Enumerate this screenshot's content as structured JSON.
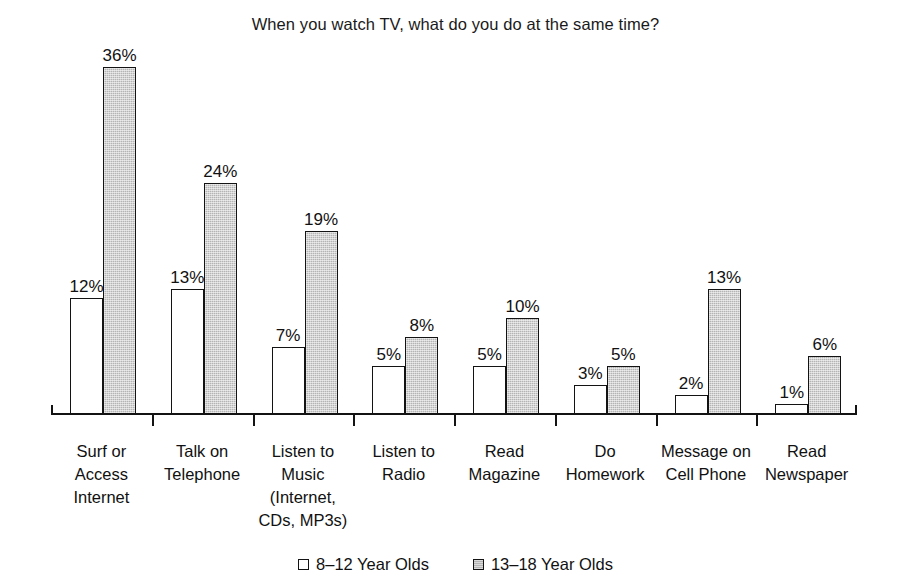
{
  "chart_data": {
    "type": "bar",
    "title": "When you watch TV, what do you do at the same time?",
    "xlabel": "",
    "ylabel": "",
    "ylim": [
      0,
      38
    ],
    "grid": false,
    "legend_position": "bottom",
    "value_suffix": "%",
    "categories": [
      "Surf or\nAccess\nInternet",
      "Talk on\nTelephone",
      "Listen to\nMusic\n(Internet,\nCDs, MP3s)",
      "Listen to\nRadio",
      "Read\nMagazine",
      "Do\nHomework",
      "Message on\nCell Phone",
      "Read\nNewspaper"
    ],
    "series": [
      {
        "name": "8–12 Year Olds",
        "color": "#ffffff",
        "values": [
          12,
          13,
          7,
          5,
          5,
          3,
          2,
          1
        ],
        "labels": [
          "12%",
          "13%",
          "7%",
          "5%",
          "5%",
          "3%",
          "2%",
          "1%"
        ]
      },
      {
        "name": "13–18 Year Olds",
        "color": "#b4b4b4",
        "values": [
          36,
          24,
          19,
          8,
          10,
          5,
          13,
          6
        ],
        "labels": [
          "36%",
          "24%",
          "19%",
          "8%",
          "10%",
          "5%",
          "13%",
          "6%"
        ]
      }
    ]
  },
  "legend": {
    "items": [
      {
        "label": "8–12 Year Olds",
        "swatch": "light"
      },
      {
        "label": "13–18 Year Olds",
        "swatch": "dark"
      }
    ]
  }
}
